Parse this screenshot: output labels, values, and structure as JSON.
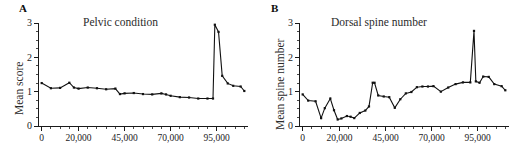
{
  "figure": {
    "background_color": "#ffffff",
    "line_color": "#111111",
    "axis_color": "#1a1a1a",
    "text_color": "#2b2b2b"
  },
  "panels": {
    "a": {
      "letter": "A",
      "title": "Pelvic condition",
      "ylabel": "Mean score"
    },
    "b": {
      "letter": "B",
      "title": "Dorsal spine number",
      "ylabel": "Mean spine number"
    }
  },
  "chart_data": [
    {
      "type": "line",
      "panel": "A",
      "title": "Pelvic condition",
      "xlabel": "",
      "ylabel": "Mean score",
      "xlim": [
        -2000,
        112000
      ],
      "ylim": [
        0,
        3
      ],
      "yticks": [
        0,
        1,
        2,
        3
      ],
      "ytick_labels": [
        "0",
        "1",
        "2",
        "3"
      ],
      "yminor_step": 0.25,
      "xticks": [
        0,
        20000,
        45000,
        70000,
        95000
      ],
      "xtick_labels": [
        "0",
        "20,000",
        "45,000",
        "70,000",
        "95,000"
      ],
      "xminor_step": 5000,
      "grid": false,
      "legend": null,
      "markers": "filled-square",
      "x": [
        0,
        5000,
        10000,
        15000,
        17500,
        20000,
        25000,
        30000,
        35000,
        40000,
        42500,
        45000,
        50000,
        55000,
        60000,
        65000,
        67500,
        70000,
        75000,
        80000,
        85000,
        90000,
        93000,
        94000,
        96000,
        98000,
        101000,
        104000,
        108000,
        110000
      ],
      "values": [
        1.25,
        1.1,
        1.11,
        1.26,
        1.12,
        1.09,
        1.12,
        1.1,
        1.07,
        1.09,
        0.93,
        0.95,
        0.96,
        0.93,
        0.92,
        0.95,
        0.92,
        0.88,
        0.84,
        0.83,
        0.8,
        0.8,
        0.8,
        2.95,
        2.74,
        1.46,
        1.24,
        1.17,
        1.15,
        1.02
      ]
    },
    {
      "type": "line",
      "panel": "B",
      "title": "Dorsal spine number",
      "xlabel": "",
      "ylabel": "Mean spine number",
      "xlim": [
        -2000,
        112000
      ],
      "ylim": [
        0,
        3
      ],
      "yticks": [
        0,
        1,
        2,
        3
      ],
      "ytick_labels": [
        "0",
        "1",
        "2",
        "3"
      ],
      "yminor_step": 0.25,
      "xticks": [
        0,
        20000,
        45000,
        70000,
        95000
      ],
      "xtick_labels": [
        "0",
        "20,000",
        "45,000",
        "70,000",
        "95,000"
      ],
      "xminor_step": 5000,
      "grid": false,
      "legend": null,
      "markers": "filled-square",
      "x": [
        0,
        3000,
        7000,
        10000,
        12000,
        15000,
        17000,
        19000,
        21000,
        24000,
        26000,
        28000,
        31000,
        34000,
        36000,
        38000,
        39000,
        41000,
        44000,
        47000,
        50000,
        53000,
        56000,
        59000,
        62000,
        65000,
        68000,
        71000,
        75000,
        79000,
        83000,
        87000,
        91000,
        93000,
        94000,
        96000,
        98000,
        101000,
        104000,
        108000,
        110000
      ],
      "values": [
        0.92,
        0.74,
        0.72,
        0.23,
        0.52,
        0.8,
        0.46,
        0.19,
        0.22,
        0.29,
        0.27,
        0.23,
        0.38,
        0.45,
        0.57,
        1.26,
        1.26,
        0.89,
        0.86,
        0.84,
        0.53,
        0.78,
        0.95,
        0.99,
        1.13,
        1.15,
        1.15,
        1.16,
        1.0,
        1.12,
        1.22,
        1.27,
        1.27,
        2.77,
        1.3,
        1.26,
        1.44,
        1.43,
        1.22,
        1.16,
        1.04
      ]
    }
  ]
}
